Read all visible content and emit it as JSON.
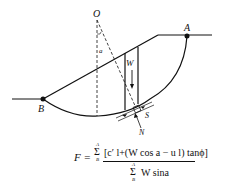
{
  "diagram": {
    "labels": {
      "center": "O",
      "point_a": "A",
      "point_b": "B",
      "weight": "W",
      "angle": "a",
      "shear": "S",
      "normal": "N"
    },
    "colors": {
      "line": "#111111",
      "background": "#ffffff"
    }
  },
  "formula": {
    "lhs": "F =",
    "sum_symbol": "Σ",
    "upper_limit": "A",
    "lower_limit": "B",
    "numerator": "[c′ l+(W cos a − u l) tanϕ]",
    "denominator": "W sina"
  }
}
